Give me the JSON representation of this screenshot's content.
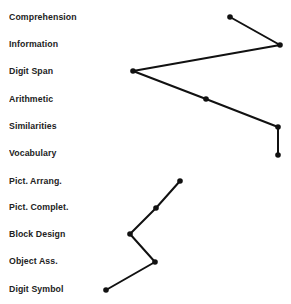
{
  "chart_data": {
    "type": "line",
    "title": "",
    "xlabel": "",
    "ylabel": "",
    "orientation": "horizontal-profile",
    "categories": [
      "Comprehension",
      "Information",
      "Digit Span",
      "Arithmetic",
      "Similarities",
      "Vocabulary",
      "Pict. Arrang.",
      "Pict. Complet.",
      "Block Design",
      "Object Ass.",
      "Digit Symbol"
    ],
    "label_y": [
      17,
      45,
      71,
      99,
      127,
      153,
      181,
      207,
      234,
      261,
      289
    ],
    "series": [
      {
        "name": "Verbal",
        "indices": [
          0,
          1,
          2,
          3,
          4,
          5
        ],
        "x_px": [
          230,
          280,
          133,
          206,
          278,
          278
        ],
        "y_px": [
          17,
          45,
          71,
          99,
          127,
          155
        ]
      },
      {
        "name": "Performance",
        "indices": [
          6,
          7,
          8,
          9,
          10
        ],
        "x_px": [
          180,
          156,
          130,
          155,
          106
        ],
        "y_px": [
          181,
          208,
          234,
          262,
          290
        ]
      }
    ],
    "grid": false,
    "legend": false,
    "line_color": "#111111"
  }
}
